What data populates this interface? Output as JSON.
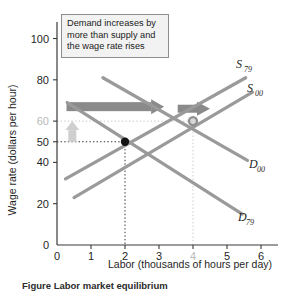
{
  "chart_data": {
    "type": "line",
    "title": "",
    "xlabel": "Labor (thousands of hours per day)",
    "ylabel": "Wage rate (dollars per hour)",
    "xlim": [
      0,
      6.5
    ],
    "ylim": [
      0,
      108
    ],
    "grid": false,
    "x_ticks": [
      "0",
      "1",
      "2",
      "3",
      "4",
      "5",
      "6"
    ],
    "x_tick_values": [
      0,
      1,
      2,
      3,
      4,
      5,
      6
    ],
    "y_ticks": [
      "0",
      "20",
      "40",
      "50",
      "60",
      "80",
      "100"
    ],
    "y_tick_values": [
      0,
      20,
      40,
      50,
      60,
      80,
      100
    ],
    "muted_x_tick": "4",
    "muted_y_tick": "60",
    "series": [
      {
        "name": "S79",
        "label": "S",
        "subscript": "79",
        "kind": "supply",
        "color": "#9a9a9a",
        "points": [
          [
            0.25,
            32
          ],
          [
            5.55,
            81
          ]
        ]
      },
      {
        "name": "S00",
        "label": "S",
        "subscript": "00",
        "kind": "supply",
        "color": "#9a9a9a",
        "points": [
          [
            0.5,
            23
          ],
          [
            5.75,
            74
          ]
        ]
      },
      {
        "name": "D79",
        "label": "D",
        "subscript": "79",
        "kind": "demand",
        "color": "#9a9a9a",
        "points": [
          [
            0.3,
            69
          ],
          [
            5.45,
            15
          ]
        ]
      },
      {
        "name": "D00",
        "label": "D",
        "subscript": "00",
        "kind": "demand",
        "color": "#9a9a9a",
        "points": [
          [
            1.35,
            81
          ],
          [
            5.6,
            41
          ]
        ]
      }
    ],
    "equilibria": [
      {
        "name": "equilibrium-1979",
        "x": 2,
        "y": 50,
        "marker": "filled",
        "color": "#141414"
      },
      {
        "name": "equilibrium-2000",
        "x": 4,
        "y": 60,
        "marker": "open",
        "color": "#8f8f8f"
      }
    ],
    "annotations": [
      {
        "name": "demand-shift-arrow",
        "direction": "right",
        "from": [
          0.28,
          67
        ],
        "to": [
          3.15,
          67
        ],
        "color": "#8a8a8a"
      },
      {
        "name": "supply-shift-arrow",
        "direction": "right",
        "from": [
          3.55,
          66
        ],
        "to": [
          4.5,
          66
        ],
        "color": "#8a8a8a"
      },
      {
        "name": "wage-rise-arrow",
        "direction": "up",
        "from": [
          0.45,
          50
        ],
        "to": [
          0.45,
          60
        ],
        "color": "#cfcfcf"
      }
    ],
    "guide_lines": [
      {
        "name": "wage-50-guide",
        "orientation": "horizontal",
        "value": 50,
        "color": "#333333"
      },
      {
        "name": "wage-60-guide",
        "orientation": "horizontal",
        "value": 60,
        "color": "#c9c9c9"
      },
      {
        "name": "labor-2-guide",
        "orientation": "vertical",
        "value": 2,
        "color": "#333333"
      },
      {
        "name": "labor-4-guide",
        "orientation": "vertical",
        "value": 4,
        "color": "#c9c9c9"
      }
    ]
  },
  "callout": {
    "name": "demand-supply-callout",
    "lines": [
      "Demand increases by",
      "more than supply and",
      "the wage rate rises"
    ]
  },
  "caption": {
    "text": "Figure  Labor market equilibrium"
  }
}
